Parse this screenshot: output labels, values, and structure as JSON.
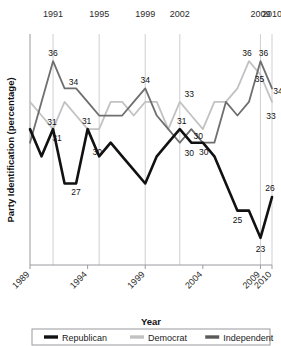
{
  "chart_data": {
    "type": "line",
    "title": "",
    "xlabel": "Year",
    "ylabel": "Party Identification (percentage)",
    "xlim": [
      1989,
      2010
    ],
    "ylim": [
      21,
      38
    ],
    "grid": "vertical",
    "legend_position": "bottom",
    "x": [
      1989,
      1990,
      1991,
      1992,
      1993,
      1994,
      1995,
      1996,
      1997,
      1998,
      1999,
      2000,
      2001,
      2002,
      2003,
      2004,
      2005,
      2006,
      2007,
      2008,
      2009,
      2010
    ],
    "top_axis_ticks": [
      "1991",
      "1995",
      "1999",
      "2002",
      "2009",
      "2010"
    ],
    "top_axis_values": [
      1991,
      1995,
      1999,
      2002,
      2009,
      2010
    ],
    "bottom_axis_ticks": [
      "1989",
      "1994",
      "1999",
      "2004",
      "2009",
      "2010"
    ],
    "bottom_axis_values": [
      1989,
      1994,
      1999,
      2004,
      2009,
      2010
    ],
    "series": [
      {
        "name": "Republican",
        "color": "#111111",
        "values": [
          31,
          29,
          31,
          27,
          27,
          31,
          29,
          30,
          29,
          28,
          27,
          29,
          30,
          31,
          30,
          30,
          29,
          27,
          25,
          25,
          23,
          26
        ]
      },
      {
        "name": "Democrat",
        "color": "#c2c2c2",
        "values": [
          33,
          32,
          31,
          33,
          32,
          31,
          31,
          33,
          33,
          32,
          33,
          33,
          31,
          33,
          32,
          31,
          33,
          33,
          34,
          36,
          35,
          33
        ]
      },
      {
        "name": "Independent",
        "color": "#6f6f6f",
        "values": [
          30,
          33,
          36,
          34,
          34,
          33,
          32,
          32,
          32,
          33,
          34,
          32,
          31,
          30,
          31,
          30,
          30,
          33,
          32,
          33,
          36,
          34
        ]
      }
    ],
    "point_labels": [
      {
        "text": "36",
        "series": "Independent",
        "x": 1991,
        "y": 36
      },
      {
        "text": "34",
        "series": "Independent",
        "x": 1992,
        "y": 34
      },
      {
        "text": "31",
        "series": "Democrat",
        "x": 1991,
        "y": 31
      },
      {
        "text": "31",
        "series": "Republican",
        "x": 1991,
        "y": 31
      },
      {
        "text": "27",
        "series": "Republican",
        "x": 1993,
        "y": 27
      },
      {
        "text": "31",
        "series": "Republican",
        "x": 1994,
        "y": 31
      },
      {
        "text": "30",
        "series": "Republican",
        "x": 1995,
        "y": 30
      },
      {
        "text": "34",
        "series": "Independent",
        "x": 1999,
        "y": 34
      },
      {
        "text": "33",
        "series": "Democrat",
        "x": 2003,
        "y": 33
      },
      {
        "text": "31",
        "series": "Democrat",
        "x": 2002,
        "y": 31
      },
      {
        "text": "30",
        "series": "Independent",
        "x": 2003,
        "y": 30
      },
      {
        "text": "30",
        "series": "Republican",
        "x": 2003,
        "y": 30
      },
      {
        "text": "30",
        "series": "Republican",
        "x": 2004,
        "y": 30
      },
      {
        "text": "36",
        "series": "Democrat",
        "x": 2008,
        "y": 36
      },
      {
        "text": "36",
        "series": "Independent",
        "x": 2009,
        "y": 36
      },
      {
        "text": "35",
        "series": "Democrat",
        "x": 2009,
        "y": 35
      },
      {
        "text": "34",
        "series": "Independent",
        "x": 2010,
        "y": 34
      },
      {
        "text": "33",
        "series": "Democrat",
        "x": 2010,
        "y": 33
      },
      {
        "text": "25",
        "series": "Republican",
        "x": 2007,
        "y": 25
      },
      {
        "text": "23",
        "series": "Republican",
        "x": 2009,
        "y": 23
      },
      {
        "text": "26",
        "series": "Republican",
        "x": 2010,
        "y": 26
      }
    ]
  },
  "legend": {
    "items": [
      {
        "label": "Republican",
        "color": "#111111"
      },
      {
        "label": "Democrat",
        "color": "#c2c2c2"
      },
      {
        "label": "Independent",
        "color": "#5a5a5a"
      }
    ]
  },
  "axis": {
    "x_title": "Year",
    "y_title": "Party Identification (percentage)"
  }
}
